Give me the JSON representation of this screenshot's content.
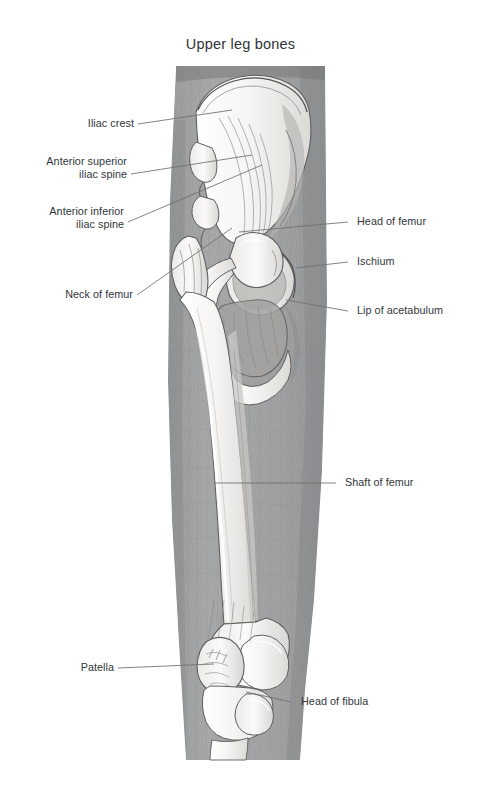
{
  "title": "Upper leg bones",
  "figure": {
    "type": "anatomical-illustration",
    "subject": "upper leg bones",
    "style": "pencil drawing, graphite shading",
    "view": "anterior-lateral right hip, femur and knee",
    "background_color": "#ffffff",
    "label_color": "#31363a",
    "leader_color": "#6e6e6e",
    "soft_tissue_color": "#9ea0a1",
    "bone_color": "#f3f2f0"
  },
  "annotations": [
    {
      "id": "iliac-crest",
      "label": "Iliac crest",
      "side": "left"
    },
    {
      "id": "anterior-superior-iliac-spine",
      "label": "Anterior superior\niliac spine",
      "side": "left"
    },
    {
      "id": "anterior-inferior-iliac-spine",
      "label": "Anterior inferior\niliac spine",
      "side": "left"
    },
    {
      "id": "neck-of-femur",
      "label": "Neck of femur",
      "side": "left"
    },
    {
      "id": "patella",
      "label": "Patella",
      "side": "left"
    },
    {
      "id": "head-of-femur",
      "label": "Head of femur",
      "side": "right"
    },
    {
      "id": "ischium",
      "label": "Ischium",
      "side": "right"
    },
    {
      "id": "lip-of-acetabulum",
      "label": "Lip of acetabulum",
      "side": "right"
    },
    {
      "id": "shaft-of-femur",
      "label": "Shaft of femur",
      "side": "right"
    },
    {
      "id": "head-of-fibula",
      "label": "Head of fibula",
      "side": "right"
    }
  ]
}
